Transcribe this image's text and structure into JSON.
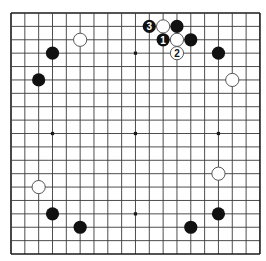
{
  "board": {
    "size": 19,
    "origin_x": 11,
    "origin_y": 13,
    "spacing_x": 13.83,
    "spacing_y": 13.39,
    "stone_radius": 6.6,
    "colors": {
      "background": "#ffffff",
      "line": "#3a3a3a",
      "black_stone": "#111111",
      "white_stone": "#ffffff",
      "white_stone_border": "#444444"
    },
    "hoshi": [
      [
        3,
        3
      ],
      [
        9,
        3
      ],
      [
        15,
        3
      ],
      [
        3,
        9
      ],
      [
        9,
        9
      ],
      [
        15,
        9
      ],
      [
        3,
        15
      ],
      [
        9,
        15
      ],
      [
        15,
        15
      ]
    ],
    "stones": [
      {
        "color": "white",
        "col": 5,
        "row": 2
      },
      {
        "color": "black",
        "col": 3,
        "row": 3
      },
      {
        "color": "black",
        "col": 2,
        "row": 5
      },
      {
        "color": "black",
        "col": 10,
        "row": 1,
        "label": "3"
      },
      {
        "color": "white",
        "col": 11,
        "row": 1
      },
      {
        "color": "black",
        "col": 12,
        "row": 1
      },
      {
        "color": "black",
        "col": 11,
        "row": 2,
        "label": "1"
      },
      {
        "color": "white",
        "col": 12,
        "row": 2
      },
      {
        "color": "black",
        "col": 13,
        "row": 2
      },
      {
        "color": "white",
        "col": 12,
        "row": 3,
        "label": "2"
      },
      {
        "color": "black",
        "col": 15,
        "row": 3
      },
      {
        "color": "white",
        "col": 16,
        "row": 5
      },
      {
        "color": "white",
        "col": 2,
        "row": 13
      },
      {
        "color": "black",
        "col": 3,
        "row": 15
      },
      {
        "color": "black",
        "col": 5,
        "row": 16
      },
      {
        "color": "white",
        "col": 15,
        "row": 12
      },
      {
        "color": "black",
        "col": 15,
        "row": 15
      },
      {
        "color": "black",
        "col": 13,
        "row": 16
      }
    ]
  }
}
